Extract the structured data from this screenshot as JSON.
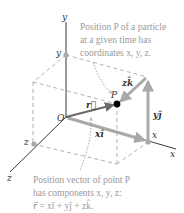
{
  "figure": {
    "type": "3d-position-vector-diagram",
    "axes": {
      "x_label": "x",
      "y_label": "y",
      "z_label": "z",
      "origin_label": "O"
    },
    "markers": {
      "x_on_axis": "x",
      "y_on_axis": "y",
      "z_on_axis": "z"
    },
    "point": {
      "label": "P"
    },
    "vectors": {
      "r": "r⃗",
      "x_component": "xî",
      "y_component": "yĵ",
      "z_component": "zk̂"
    },
    "annotations": {
      "top": {
        "line1": "Position P of a particle",
        "line2": "at a given time has",
        "line3": "coordinates x, y, z."
      },
      "bottom": {
        "line1": "Position vector of point P",
        "line2": "has components x, y, z:",
        "line3": "r⃗ = xî + yĵ + zk̂."
      }
    },
    "colors": {
      "axis": "#3a3a3a",
      "dashed": "#a8a8a8",
      "component_vectors": "#a9a9a9",
      "position_vector": "#6a6a6a",
      "point": "#000000",
      "caption_text": "#9a9a9a"
    }
  }
}
